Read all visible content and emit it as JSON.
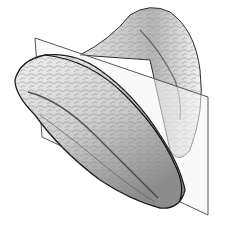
{
  "figure": {
    "type": "scientific-illustration",
    "caption": "",
    "colors": {
      "background": "#ffffff",
      "ink": "#1a1a1a",
      "shade": "#6b6b6b",
      "light": "#d9d9d9",
      "plane_edge": "#555555",
      "plane_fill": "#f4f4f4"
    },
    "plane": {
      "corners": [
        [
          35,
          38
        ],
        [
          208,
          97
        ],
        [
          208,
          215
        ],
        [
          42,
          137
        ]
      ]
    }
  }
}
